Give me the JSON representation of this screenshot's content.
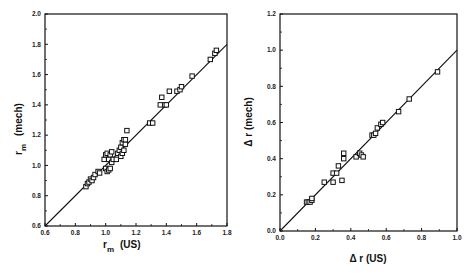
{
  "chart_data": [
    {
      "type": "scatter",
      "title": "",
      "xlabel": "r_m (US)",
      "ylabel": "r_m (mech)",
      "xlabel_main": "r",
      "xlabel_sub": "m",
      "xlabel_unit": "(US)",
      "ylabel_main": "r",
      "ylabel_sub": "m",
      "ylabel_unit": "(mech)",
      "xlim": [
        0.6,
        1.8
      ],
      "ylim": [
        0.6,
        2.0
      ],
      "xticks": [
        "0.6",
        "0.8",
        "1.0",
        "1.2",
        "1.4",
        "1.6",
        "1.8"
      ],
      "yticks": [
        "0.6",
        "0.8",
        "1.0",
        "1.2",
        "1.4",
        "1.6",
        "1.8",
        "2.0"
      ],
      "grid": false,
      "legend": null,
      "marker": "open-square",
      "fit_line": {
        "from": [
          0.6,
          0.6
        ],
        "to": [
          1.8,
          1.8
        ],
        "label": "y = x"
      },
      "series": [
        {
          "name": "r_m",
          "x": [
            0.87,
            0.88,
            0.89,
            0.9,
            0.91,
            0.92,
            0.93,
            0.95,
            0.96,
            0.99,
            1.0,
            1.0,
            1.01,
            1.01,
            1.02,
            1.02,
            1.03,
            1.03,
            1.04,
            1.04,
            1.05,
            1.07,
            1.08,
            1.09,
            1.1,
            1.1,
            1.11,
            1.11,
            1.12,
            1.12,
            1.13,
            1.13,
            1.14,
            1.29,
            1.31,
            1.36,
            1.37,
            1.39,
            1.4,
            1.42,
            1.47,
            1.49,
            1.5,
            1.57,
            1.69,
            1.72,
            1.73
          ],
          "y": [
            0.86,
            0.88,
            0.89,
            0.91,
            0.9,
            0.92,
            0.94,
            0.96,
            0.95,
            1.04,
            0.98,
            1.07,
            0.96,
            1.08,
            0.97,
            1.04,
            0.98,
            1.07,
            1.02,
            1.09,
            1.04,
            1.04,
            1.08,
            1.1,
            1.06,
            1.12,
            1.08,
            1.15,
            1.1,
            1.17,
            1.14,
            1.17,
            1.23,
            1.28,
            1.28,
            1.4,
            1.45,
            1.4,
            1.4,
            1.49,
            1.49,
            1.5,
            1.52,
            1.59,
            1.7,
            1.74,
            1.76
          ]
        }
      ]
    },
    {
      "type": "scatter",
      "title": "",
      "xlabel": "Δ r (US)",
      "ylabel": "Δ r (mech)",
      "xlim": [
        0.0,
        1.0
      ],
      "ylim": [
        0.0,
        1.2
      ],
      "xticks": [
        "0.0",
        "0.2",
        "0.4",
        "0.6",
        "0.8",
        "1.0"
      ],
      "yticks": [
        "0.0",
        "0.2",
        "0.4",
        "0.6",
        "0.8",
        "1.0",
        "1.2"
      ],
      "grid": false,
      "legend": null,
      "marker": "open-square",
      "fit_line": {
        "from": [
          0.0,
          0.0
        ],
        "to": [
          1.0,
          1.0
        ],
        "label": "y = x"
      },
      "series": [
        {
          "name": "Δr",
          "x": [
            0.15,
            0.16,
            0.17,
            0.18,
            0.18,
            0.25,
            0.3,
            0.3,
            0.32,
            0.33,
            0.35,
            0.36,
            0.36,
            0.43,
            0.45,
            0.46,
            0.47,
            0.52,
            0.53,
            0.54,
            0.55,
            0.57,
            0.58,
            0.67,
            0.73,
            0.89
          ],
          "y": [
            0.16,
            0.16,
            0.16,
            0.17,
            0.18,
            0.27,
            0.27,
            0.32,
            0.32,
            0.36,
            0.28,
            0.4,
            0.43,
            0.41,
            0.43,
            0.42,
            0.41,
            0.53,
            0.53,
            0.54,
            0.57,
            0.59,
            0.6,
            0.66,
            0.73,
            0.88
          ]
        }
      ]
    }
  ]
}
